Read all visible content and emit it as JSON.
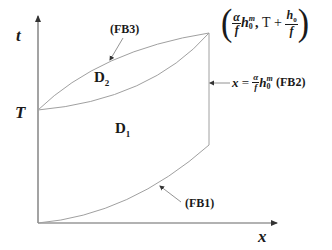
{
  "diagram": {
    "axes": {
      "y_label": "t",
      "x_label": "x",
      "t_marker": "T"
    },
    "regions": {
      "upper": {
        "label": "D",
        "subscript": "2"
      },
      "lower": {
        "label": "D",
        "subscript": "1"
      }
    },
    "boundaries": {
      "fb1": "(FB1)",
      "fb2": "(FB2)",
      "fb3": "(FB3)"
    },
    "corner_point": {
      "alpha": "α",
      "f": "f",
      "h": "h",
      "sub0": "0",
      "sup_m": "m",
      "comma": ",",
      "T": "T",
      "plus": "+",
      "h0": "h",
      "h0_sub": "0",
      "f2": "f",
      "open": "(",
      "close": ")"
    },
    "fb2_equation": {
      "x": "x",
      "eq": "=",
      "alpha": "α",
      "f": "f",
      "h": "h",
      "sub0": "0",
      "sup_m": "m"
    },
    "colors": {
      "line": "#9a9a9a",
      "axis": "#555555",
      "text": "#1a1a1a"
    }
  }
}
